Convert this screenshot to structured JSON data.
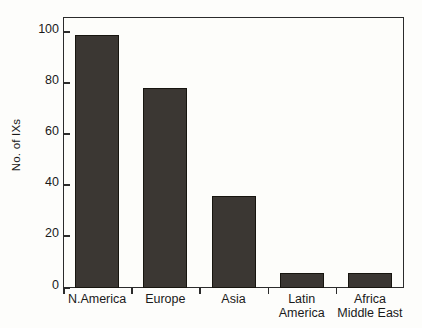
{
  "chart_data": {
    "type": "bar",
    "title": "",
    "subtitle": "",
    "xlabel": "",
    "ylabel": "No. of IXs",
    "categories": [
      "N.America",
      "Europe",
      "Asia",
      "Latin America",
      "Africa Middle East"
    ],
    "values": [
      99,
      78,
      36,
      6,
      6
    ],
    "ylim": [
      0,
      100
    ],
    "yticks": [
      0,
      20,
      40,
      60,
      80,
      100
    ],
    "ytick_labels": [
      "0",
      "20",
      "40",
      "60",
      "80",
      "100"
    ],
    "grid": false,
    "legend": null,
    "legend_position": "none",
    "series": [
      {
        "name": "No. of IXs",
        "values": [
          99,
          78,
          36,
          6,
          6
        ],
        "color": "#3b3733"
      }
    ],
    "annotations": [],
    "colors": {
      "bar_fill": "#3b3733",
      "bar_edge": "#17150f",
      "axis": "#2b2b2b",
      "background": "#fdfdfb",
      "text": "#1a1a1a"
    }
  }
}
